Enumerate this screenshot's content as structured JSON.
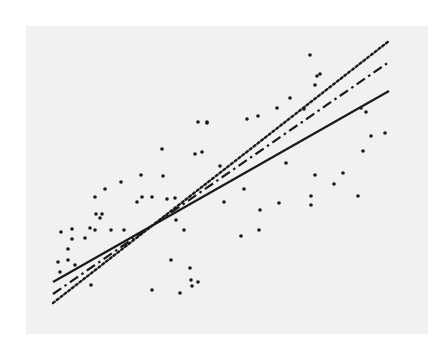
{
  "chart_data": {
    "type": "scatter",
    "title": "",
    "xlabel": "",
    "ylabel": "",
    "grid": false,
    "legend": null,
    "background": "#f1f1f1",
    "point_color": "#1a1a1a",
    "coordinate_space": "pixel (image coords, 445x345)",
    "points": [
      [
        58,
        262
      ],
      [
        60,
        272
      ],
      [
        61,
        232
      ],
      [
        68,
        260
      ],
      [
        72,
        229
      ],
      [
        72,
        239
      ],
      [
        68,
        249
      ],
      [
        75,
        265
      ],
      [
        85,
        238
      ],
      [
        90,
        228
      ],
      [
        91,
        285
      ],
      [
        95,
        230
      ],
      [
        95,
        197
      ],
      [
        96,
        214
      ],
      [
        100,
        218
      ],
      [
        102,
        214
      ],
      [
        105,
        189
      ],
      [
        111,
        230
      ],
      [
        121,
        182
      ],
      [
        124,
        230
      ],
      [
        137,
        202
      ],
      [
        141,
        175
      ],
      [
        142,
        197
      ],
      [
        152,
        197
      ],
      [
        162,
        149
      ],
      [
        163,
        176
      ],
      [
        167,
        199
      ],
      [
        175,
        198
      ],
      [
        171,
        260
      ],
      [
        176,
        220
      ],
      [
        184,
        230
      ],
      [
        190,
        268
      ],
      [
        192,
        286
      ],
      [
        195,
        154
      ],
      [
        198,
        122
      ],
      [
        202,
        152
      ],
      [
        207,
        122
      ],
      [
        191,
        280
      ],
      [
        198,
        282
      ],
      [
        180,
        293
      ],
      [
        152,
        290
      ],
      [
        207,
        123
      ],
      [
        220,
        166
      ],
      [
        224,
        202
      ],
      [
        241,
        236
      ],
      [
        244,
        189
      ],
      [
        247,
        119
      ],
      [
        258,
        116
      ],
      [
        260,
        210
      ],
      [
        259,
        230
      ],
      [
        277,
        108
      ],
      [
        279,
        203
      ],
      [
        286,
        163
      ],
      [
        290,
        98
      ],
      [
        304,
        109
      ],
      [
        310,
        55
      ],
      [
        311,
        196
      ],
      [
        311,
        205
      ],
      [
        315,
        85
      ],
      [
        315,
        175
      ],
      [
        317,
        76
      ],
      [
        320,
        74
      ],
      [
        334,
        184
      ],
      [
        343,
        173
      ],
      [
        358,
        196
      ],
      [
        361,
        108
      ],
      [
        363,
        151
      ],
      [
        366,
        112
      ],
      [
        371,
        136
      ],
      [
        385,
        133
      ]
    ],
    "lines": [
      {
        "name": "solid",
        "style": "solid",
        "x1": 53,
        "y1": 282,
        "x2": 389,
        "y2": 91,
        "width": 2.2
      },
      {
        "name": "dash-dot",
        "style": "dash-dot",
        "x1": 53,
        "y1": 294,
        "x2": 389,
        "y2": 62,
        "width": 2.2
      },
      {
        "name": "dotted",
        "style": "dotted",
        "x1": 53,
        "y1": 303,
        "x2": 389,
        "y2": 41,
        "width": 2.4
      }
    ]
  }
}
